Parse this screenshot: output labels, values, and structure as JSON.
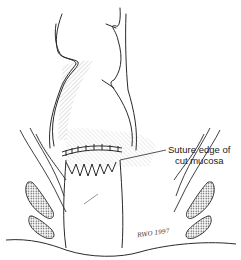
{
  "figure": {
    "type": "anatomical line illustration",
    "callout": {
      "line1": "Suture edge of",
      "line2": "cut mucosa"
    },
    "signature": "RWO 1997",
    "colors": {
      "background": "#ffffff",
      "ink": "#2a2a2a",
      "hatch": "#555555"
    }
  }
}
